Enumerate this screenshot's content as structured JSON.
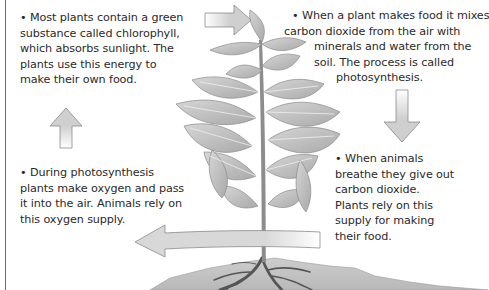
{
  "diagram": {
    "topic": "Photosynthesis and gas exchange cycle",
    "style": "grayscale illustration",
    "colors": {
      "text": "#2a2a2a",
      "arrow_fill": "#cfcfcf",
      "arrow_stroke": "#8a8a8a",
      "leaf": "#b9b9b9",
      "leaf_vein": "#eeeeee",
      "stem": "#8c8c8c",
      "soil": "#c4c4c4",
      "roots": "#5a5a5a",
      "border": "#6b6b6b"
    },
    "blocks": [
      {
        "id": "chlorophyll",
        "position": "top-left",
        "lines": [
          "• Most plants contain a green",
          "substance called chlorophyll,",
          "which absorbs sunlight. The",
          "plants use this energy to",
          "make their own food."
        ]
      },
      {
        "id": "photosynthesis",
        "position": "top-right",
        "lines": [
          "• When a plant makes food it mixes",
          "carbon dioxide from the air with",
          "minerals and water from the",
          "soil. The process is called",
          "photosynthesis."
        ]
      },
      {
        "id": "carbon-dioxide",
        "position": "bottom-right",
        "lines": [
          "• When animals",
          "breathe they give out",
          "carbon dioxide.",
          "Plants rely on this",
          "supply for making",
          "their food."
        ]
      },
      {
        "id": "oxygen",
        "position": "bottom-left",
        "lines": [
          "• During photosynthesis",
          "plants make oxygen and pass",
          "it into the air. Animals rely on",
          "this oxygen supply."
        ]
      }
    ],
    "arrows": [
      {
        "id": "arrow-right",
        "direction": "right",
        "from": "chlorophyll",
        "to": "photosynthesis"
      },
      {
        "id": "arrow-down",
        "direction": "down",
        "from": "photosynthesis",
        "to": "carbon-dioxide"
      },
      {
        "id": "arrow-left",
        "direction": "left",
        "from": "carbon-dioxide",
        "to": "oxygen"
      },
      {
        "id": "arrow-up",
        "direction": "up",
        "from": "oxygen",
        "to": "chlorophyll"
      }
    ],
    "illustration": [
      "plant-icon",
      "leaf-icon",
      "stem-icon",
      "roots-icon",
      "soil-icon"
    ]
  }
}
